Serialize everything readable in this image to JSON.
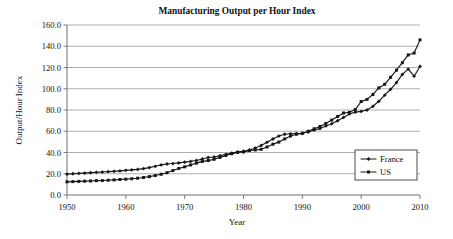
{
  "chart_data": {
    "type": "line",
    "title": "Manufacturing Output per Hour Index",
    "xlabel": "Year",
    "ylabel": "Output/Hour Index",
    "xlim": [
      1950,
      2010
    ],
    "ylim": [
      0,
      160
    ],
    "xticks": [
      1950,
      1960,
      1970,
      1980,
      1990,
      2000,
      2010
    ],
    "xtick_labels": [
      "1950",
      "1960",
      "1970",
      "1980",
      "1990",
      "2000",
      "2010"
    ],
    "yticks": [
      0,
      20,
      40,
      60,
      80,
      100,
      120,
      140,
      160
    ],
    "ytick_labels": [
      "0.0",
      "20.0",
      "40.0",
      "60.0",
      "80.0",
      "100.0",
      "120.0",
      "140.0",
      "160.0"
    ],
    "grid": "horizontal",
    "legend_position": "bottom-right",
    "x": [
      1950,
      1951,
      1952,
      1953,
      1954,
      1955,
      1956,
      1957,
      1958,
      1959,
      1960,
      1961,
      1962,
      1963,
      1964,
      1965,
      1966,
      1967,
      1968,
      1969,
      1970,
      1971,
      1972,
      1973,
      1974,
      1975,
      1976,
      1977,
      1978,
      1979,
      1980,
      1981,
      1982,
      1983,
      1984,
      1985,
      1986,
      1987,
      1988,
      1989,
      1990,
      1991,
      1992,
      1993,
      1994,
      1995,
      1996,
      1997,
      1998,
      1999,
      2000,
      2001,
      2002,
      2003,
      2004,
      2005,
      2006,
      2007,
      2008,
      2009,
      2010
    ],
    "series": [
      {
        "name": "France",
        "marker": "diamond",
        "color": "#171717",
        "values": [
          19.6,
          20.0,
          20.3,
          20.6,
          21.0,
          21.3,
          21.6,
          22.0,
          22.3,
          22.7,
          23.2,
          23.6,
          24.1,
          24.8,
          25.8,
          27.0,
          28.3,
          29.2,
          29.6,
          30.2,
          30.9,
          31.6,
          32.5,
          33.9,
          35.3,
          35.8,
          37.0,
          38.2,
          39.4,
          40.6,
          41.2,
          42.4,
          44.2,
          46.6,
          49.6,
          52.7,
          55.5,
          57.2,
          57.6,
          57.8,
          58.1,
          59.3,
          61.2,
          62.5,
          65.0,
          67.0,
          69.9,
          73.0,
          76.3,
          78.0,
          78.7,
          80.0,
          83.5,
          88.2,
          94.0,
          99.5,
          105.8,
          113.5,
          118.5,
          111.8,
          121.0
        ]
      },
      {
        "name": "US",
        "marker": "square",
        "color": "#171717",
        "values": [
          12.4,
          12.6,
          12.8,
          13.0,
          13.2,
          13.5,
          13.6,
          13.9,
          14.2,
          14.6,
          14.9,
          15.3,
          15.8,
          16.5,
          17.3,
          18.3,
          19.5,
          21.0,
          23.0,
          25.0,
          26.5,
          28.3,
          30.0,
          31.6,
          32.4,
          33.6,
          35.4,
          37.2,
          38.8,
          40.0,
          40.5,
          41.8,
          42.4,
          43.0,
          45.2,
          47.8,
          49.8,
          52.8,
          55.5,
          57.2,
          58.0,
          60.0,
          62.3,
          64.5,
          67.3,
          70.5,
          73.9,
          77.2,
          77.8,
          80.4,
          88.0,
          90.0,
          94.6,
          100.8,
          104.2,
          110.8,
          117.5,
          124.5,
          131.8,
          133.6,
          146.0
        ]
      }
    ]
  },
  "legend": {
    "entries": [
      {
        "label": "France"
      },
      {
        "label": "US"
      }
    ]
  }
}
